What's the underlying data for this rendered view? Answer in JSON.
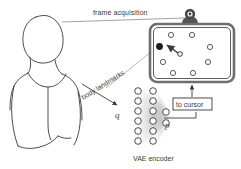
{
  "figure": {
    "type": "diagram",
    "background_color": "#ffffff",
    "ink_color": "#3a3a3a",
    "caption": "VAE encoder"
  },
  "labels": {
    "frame_acquisition": "frame acquisition",
    "body_landmarks": "body landmarks",
    "latent_q": "q",
    "output_p": "p",
    "to_cursor": "to cursor",
    "vae_encoder": "VAE encoder"
  },
  "person": {
    "name": "seated-person-outline",
    "description": "line drawing of head, neck, shoulders and torso"
  },
  "camera": {
    "name": "webcam",
    "position": {
      "x": 190,
      "y": 16
    }
  },
  "screen": {
    "name": "display-screen",
    "rect": {
      "x": 150,
      "y": 24,
      "width": 84,
      "height": 58,
      "radius": 7
    },
    "targets": [
      {
        "x": 171,
        "y": 35,
        "state": "idle"
      },
      {
        "x": 192,
        "y": 35,
        "state": "idle"
      },
      {
        "x": 159,
        "y": 47,
        "state": "active"
      },
      {
        "x": 210,
        "y": 47,
        "state": "idle"
      },
      {
        "x": 163,
        "y": 62,
        "state": "idle"
      },
      {
        "x": 208,
        "y": 62,
        "state": "idle"
      },
      {
        "x": 173,
        "y": 73,
        "state": "idle"
      },
      {
        "x": 193,
        "y": 73,
        "state": "idle"
      }
    ],
    "cursor": {
      "x": 180,
      "y": 52
    },
    "cursor_vector": {
      "from": {
        "x": 179,
        "y": 51
      },
      "to": {
        "x": 167,
        "y": 43
      }
    }
  },
  "network": {
    "name": "vae-encoder",
    "layers": [
      {
        "name": "input-layer",
        "x": 138,
        "nodes": 6,
        "y_start": 90,
        "y_step": 10
      },
      {
        "name": "hidden-layer",
        "x": 153,
        "nodes": 6,
        "y_start": 90,
        "y_step": 10
      },
      {
        "name": "latent-layer",
        "x": 166,
        "nodes": 2,
        "y_start": 112,
        "y_step": 11
      }
    ],
    "node_radius": 3.3,
    "node_fill": "#ffffff",
    "node_stroke": "#3a3a3a"
  },
  "flows": [
    {
      "name": "person-to-camera",
      "label": "frame acquisition"
    },
    {
      "name": "landmarks-to-encoder",
      "label": "body landmarks"
    },
    {
      "name": "latent-to-cursor",
      "label": "to cursor"
    },
    {
      "name": "cursor-to-screen",
      "label": ""
    }
  ]
}
